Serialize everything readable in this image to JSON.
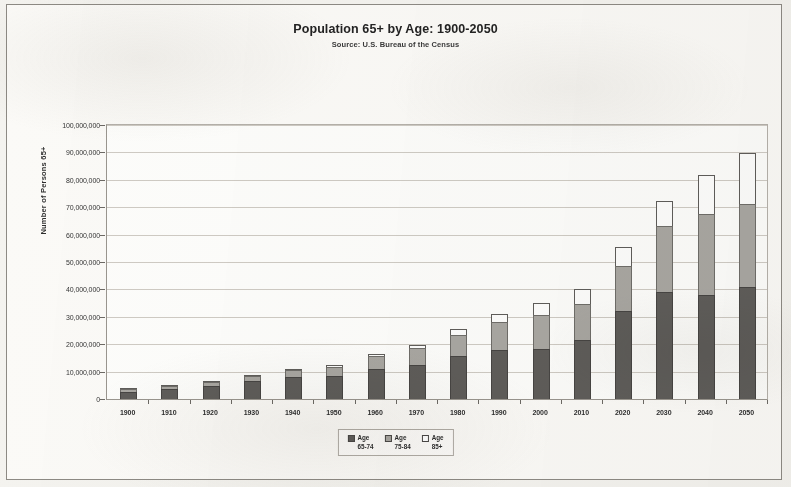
{
  "chart_data": {
    "type": "bar",
    "stacked": true,
    "title": "Population 65+ by Age: 1900-2050",
    "subtitle": "Source: U.S. Bureau of the Census",
    "xlabel": "",
    "ylabel": "Number of Persons 65+",
    "ylim": [
      0,
      100000000
    ],
    "ytick_step": 10000000,
    "grid": true,
    "legend_position": "bottom-center",
    "categories": [
      "1900",
      "1910",
      "1920",
      "1930",
      "1940",
      "1950",
      "1960",
      "1970",
      "1980",
      "1990",
      "2000",
      "2010",
      "2020",
      "2030",
      "2040",
      "2050"
    ],
    "ytick_labels": [
      "0",
      "10,000,000",
      "20,000,000",
      "30,000,000",
      "40,000,000",
      "50,000,000",
      "60,000,000",
      "70,000,000",
      "80,000,000",
      "90,000,000",
      "100,000,000"
    ],
    "series": [
      {
        "name": "Age 65-74",
        "color": "#5f5d5a",
        "values": [
          2700000,
          3600000,
          4900000,
          6500000,
          8000000,
          8400000,
          11000000,
          12400000,
          15600000,
          18000000,
          18400000,
          21700000,
          32300000,
          39000000,
          37900000,
          40900000
        ]
      },
      {
        "name": "Age 75-84",
        "color": "#a9a7a2",
        "values": [
          800000,
          1100000,
          1400000,
          1900000,
          2600000,
          3300000,
          4600000,
          6100000,
          7700000,
          10000000,
          12400000,
          12800000,
          16400000,
          24300000,
          29700000,
          30100000
        ]
      },
      {
        "name": "Age 85+",
        "color": "#ffffff",
        "values": [
          100000,
          200000,
          200000,
          300000,
          400000,
          600000,
          900000,
          1400000,
          2200000,
          3000000,
          4200000,
          5800000,
          6700000,
          9000000,
          14200000,
          18900000
        ]
      }
    ],
    "totals": [
      3600000,
      4900000,
      6500000,
      8700000,
      11000000,
      12300000,
      16500000,
      19900000,
      25500000,
      31000000,
      35000000,
      40300000,
      55400000,
      72300000,
      81800000,
      89900000
    ],
    "legend": [
      {
        "label_line1": "Age",
        "label_line2": "65-74",
        "swatch": "dark-filled"
      },
      {
        "label_line1": "Age",
        "label_line2": "75-84",
        "swatch": "gray-filled"
      },
      {
        "label_line1": "Age",
        "label_line2": "85+",
        "swatch": "open-white"
      }
    ]
  }
}
